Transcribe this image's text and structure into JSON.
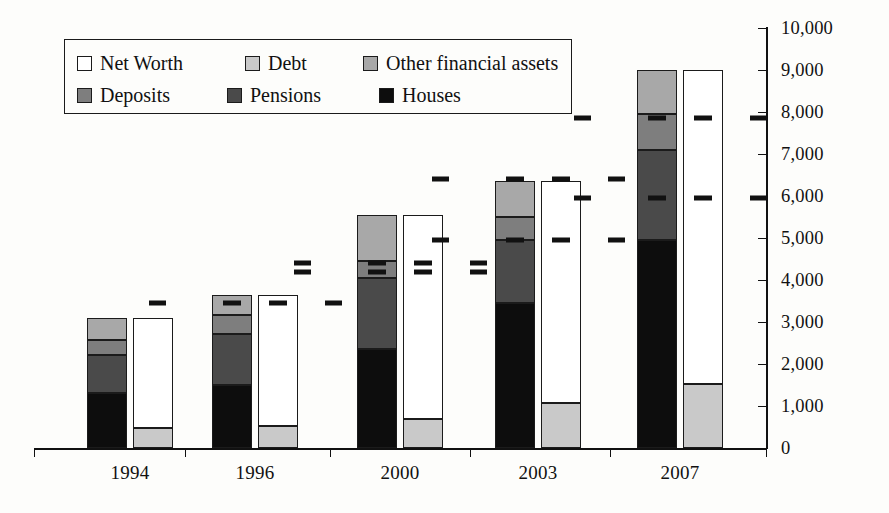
{
  "chart_data": {
    "type": "bar",
    "subtype": "paired stacked bars (assets vs liabilities/net worth)",
    "title": "",
    "xlabel": "",
    "ylabel": "",
    "categories": [
      "1994",
      "1996",
      "2000",
      "2003",
      "2007"
    ],
    "ylim": [
      0,
      10000
    ],
    "ytick_values": [
      0,
      1000,
      2000,
      3000,
      4000,
      5000,
      6000,
      7000,
      8000,
      9000,
      10000
    ],
    "ytick_labels": [
      "0",
      "1,000",
      "2,000",
      "3,000",
      "4,000",
      "5,000",
      "6,000",
      "7,000",
      "8,000",
      "9,000",
      "10,000"
    ],
    "y_axis_position": "right",
    "grid": false,
    "legend_position": "top-left inside plot",
    "series": [
      {
        "name": "Houses",
        "bar": "assets",
        "stack_order": 1,
        "color": "#0d0d0d",
        "values": [
          1320,
          1510,
          2350,
          3450,
          4950
        ]
      },
      {
        "name": "Pensions",
        "bar": "assets",
        "stack_order": 2,
        "color": "#4a4a4a",
        "values": [
          900,
          1200,
          1700,
          1500,
          2150
        ]
      },
      {
        "name": "Deposits",
        "bar": "assets",
        "stack_order": 3,
        "color": "#7e7e7e",
        "values": [
          340,
          450,
          400,
          550,
          850
        ]
      },
      {
        "name": "Other financial assets",
        "bar": "assets",
        "stack_order": 4,
        "color": "#a8a8a8",
        "values": [
          540,
          490,
          1100,
          850,
          1050
        ]
      },
      {
        "name": "Debt",
        "bar": "liabilities",
        "stack_order": 1,
        "color": "#c9c9c9",
        "values": [
          480,
          530,
          700,
          1080,
          1530
        ]
      },
      {
        "name": "Net Worth",
        "bar": "liabilities",
        "stack_order": 2,
        "color": "#ffffff",
        "values": [
          2620,
          3120,
          4850,
          5270,
          7470
        ]
      }
    ],
    "bar_totals": {
      "assets": [
        3100,
        3650,
        5550,
        6350,
        9000
      ],
      "liabilities": [
        3100,
        3650,
        5550,
        6350,
        9000
      ]
    },
    "annotation_markers": {
      "style": "short horizontal dashes",
      "color": "#111111",
      "per_category": [
        {
          "category": "1994",
          "values": []
        },
        {
          "category": "1996",
          "values": [
            3450
          ]
        },
        {
          "category": "2000",
          "values": [
            4400,
            4200
          ]
        },
        {
          "category": "2003",
          "values": [
            6400,
            4950
          ]
        },
        {
          "category": "2007",
          "values": [
            7850,
            5950
          ]
        }
      ]
    }
  },
  "legend": {
    "rows": [
      [
        {
          "label": "Net Worth",
          "swatch": "#ffffff"
        },
        {
          "label": "Debt",
          "swatch": "#c9c9c9"
        },
        {
          "label": "Other financial assets",
          "swatch": "#a8a8a8"
        }
      ],
      [
        {
          "label": "Deposits",
          "swatch": "#7e7e7e"
        },
        {
          "label": "Pensions",
          "swatch": "#4a4a4a"
        },
        {
          "label": "Houses",
          "swatch": "#0d0d0d"
        }
      ]
    ]
  }
}
